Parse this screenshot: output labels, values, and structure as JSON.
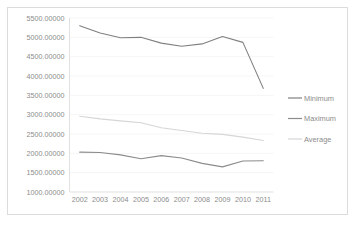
{
  "chart_data": {
    "type": "line",
    "title": "",
    "xlabel": "",
    "ylabel": "",
    "categories": [
      "2002",
      "2003",
      "2004",
      "2005",
      "2006",
      "2007",
      "2008",
      "2009",
      "2010",
      "2011"
    ],
    "ylim": [
      1000,
      5500
    ],
    "ytick_step": 500,
    "ytick_labels": [
      "5500.00000",
      "5000.00000",
      "4500.00000",
      "4000.00000",
      "3500.00000",
      "3000.00000",
      "2500.00000",
      "2000.00000",
      "1500.00000",
      "1000.00000"
    ],
    "ytick_values": [
      5500,
      5000,
      4500,
      4000,
      3500,
      3000,
      2500,
      2000,
      1500,
      1000
    ],
    "grid": true,
    "legend_position": "right",
    "series": [
      {
        "name": "Minimum",
        "color": "#808080",
        "values": [
          5300,
          5110,
          4990,
          5000,
          4850,
          4770,
          4830,
          5020,
          4870,
          3680
        ]
      },
      {
        "name": "Maximum",
        "color": "#8c8c8c",
        "values": [
          2030,
          2020,
          1960,
          1860,
          1940,
          1880,
          1740,
          1650,
          1800,
          1810
        ]
      },
      {
        "name": "Average",
        "color": "#d6d6d6",
        "values": [
          2960,
          2890,
          2840,
          2790,
          2660,
          2590,
          2520,
          2490,
          2420,
          2330
        ]
      }
    ]
  },
  "legend": {
    "items": [
      {
        "label": "Minimum",
        "color": "#808080"
      },
      {
        "label": "Maximum",
        "color": "#8c8c8c"
      },
      {
        "label": "Average",
        "color": "#d6d6d6"
      }
    ]
  },
  "colors": {
    "frame": "#dcdcdc",
    "grid": "#f2f2f2",
    "axis": "#d9d9d9",
    "text": "#8c8c8c",
    "background": "#ffffff"
  }
}
